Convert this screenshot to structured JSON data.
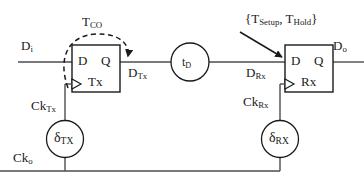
{
  "diagram": {
    "colors": {
      "line": "#4d4d4d",
      "text": "#1a1a1a",
      "background": "#ffffff",
      "dashed": "#1a1a1a"
    },
    "signals": {
      "data_in": "D",
      "data_in_sub": "i",
      "data_tx": "D",
      "data_tx_sub": "Tx",
      "data_rx": "D",
      "data_rx_sub": "Rx",
      "data_out": "D",
      "data_out_sub": "o",
      "clock_in": "Ck",
      "clock_in_sub": "o",
      "clock_tx": "Ck",
      "clock_tx_sub": "Tx",
      "clock_rx": "Ck",
      "clock_rx_sub": "Rx"
    },
    "blocks": {
      "tx_flipflop": {
        "input_pin": "D",
        "output_pin": "Q",
        "name": "Tx"
      },
      "rx_flipflop": {
        "input_pin": "D",
        "output_pin": "Q",
        "name": "Rx"
      },
      "delay_line": {
        "label": "t",
        "label_sub": "D"
      },
      "tx_clock_delay": {
        "label": "δ",
        "label_sub": "TX"
      },
      "rx_clock_delay": {
        "label": "δ",
        "label_sub": "RX"
      }
    },
    "annotations": {
      "clock_to_out": "T",
      "clock_to_out_sub": "CO",
      "setup_hold_open": "{T",
      "setup_hold_sub1": "Setup",
      "setup_hold_mid": ", T",
      "setup_hold_sub2": "Hold",
      "setup_hold_close": "}"
    }
  }
}
